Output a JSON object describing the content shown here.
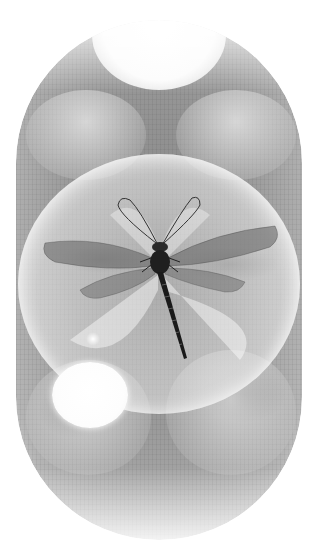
{
  "artwork": {
    "subject": "dragonfly",
    "composition": "dragonfly inside large translucent bubble within a rounded pill-shaped frame",
    "palette": {
      "background": "#ffffff",
      "texture_mid": "#9a9a9a",
      "bubble_highlight": "#ffffff",
      "dragonfly_body": "#2a2a2a",
      "wing_tint": "#707070"
    },
    "elements": [
      "pill-frame",
      "textured-background",
      "top-bubble",
      "upper-left-bubble",
      "upper-right-bubble",
      "main-bubble",
      "small-bright-bubble",
      "lower-left-bubble",
      "lower-right-bubble",
      "dragonfly"
    ]
  }
}
